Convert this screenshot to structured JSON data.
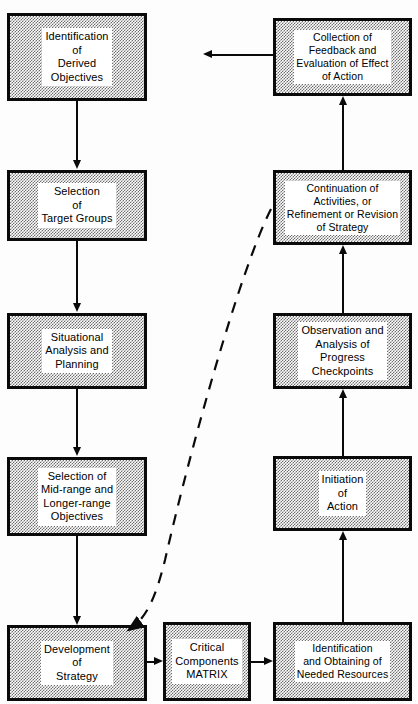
{
  "diagram": {
    "colors": {
      "box_border": "#0a0a0a",
      "box_fill_stipple": "#6e6e6e",
      "label_background": "#ffffff",
      "text": "#000000",
      "connector": "#0a0a0a",
      "page_background": "#fdfdfd"
    },
    "nodes": [
      {
        "id": "identification-of-derived-objectives",
        "text": "Identification\nof\nDerived\nObjectives",
        "column": "left",
        "row": 1
      },
      {
        "id": "selection-of-target-groups",
        "text": "Selection\nof\nTarget Groups",
        "column": "left",
        "row": 2
      },
      {
        "id": "situational-analysis-and-planning",
        "text": "Situational\nAnalysis and\nPlanning",
        "column": "left",
        "row": 3
      },
      {
        "id": "selection-of-mid-range-and-longer-range-objectives",
        "text": "Selection of\nMid-range and\nLonger-range\nObjectives",
        "column": "left",
        "row": 4
      },
      {
        "id": "development-of-strategy",
        "text": "Development\nof\nStrategy",
        "column": "left",
        "row": 5
      },
      {
        "id": "critical-components-matrix",
        "text": "Critical\nComponents\nMATRIX",
        "column": "center",
        "row": 5
      },
      {
        "id": "identification-and-obtaining-of-needed-resources",
        "text": "Identification\nand Obtaining of\nNeeded Resources",
        "column": "right",
        "row": 5
      },
      {
        "id": "initiation-of-action",
        "text": "Initiation\nof\nAction",
        "column": "right",
        "row": 4
      },
      {
        "id": "observation-and-analysis-of-progress-checkpoints",
        "text": "Observation and\nAnalysis of\nProgress\nCheckpoints",
        "column": "right",
        "row": 3
      },
      {
        "id": "continuation-of-activities-or-refinement-or-revision-of-strategy",
        "text": "Continuation of\nActivities, or\nRefinement or Revision\nof Strategy",
        "column": "right",
        "row": 2
      },
      {
        "id": "collection-of-feedback-and-evaluation-of-effect-of-action",
        "text": "Collection of\nFeedback and\nEvaluation of Effect\nof Action",
        "column": "right",
        "row": 1
      }
    ],
    "connectors": [
      {
        "id": "c1",
        "from": "identification-of-derived-objectives",
        "to": "selection-of-target-groups",
        "style": "solid",
        "direction": "down"
      },
      {
        "id": "c2",
        "from": "selection-of-target-groups",
        "to": "situational-analysis-and-planning",
        "style": "solid",
        "direction": "down"
      },
      {
        "id": "c3",
        "from": "situational-analysis-and-planning",
        "to": "selection-of-mid-range-and-longer-range-objectives",
        "style": "solid",
        "direction": "down"
      },
      {
        "id": "c4",
        "from": "selection-of-mid-range-and-longer-range-objectives",
        "to": "development-of-strategy",
        "style": "solid",
        "direction": "down"
      },
      {
        "id": "c5",
        "from": "development-of-strategy",
        "to": "critical-components-matrix",
        "style": "solid",
        "direction": "right"
      },
      {
        "id": "c6",
        "from": "critical-components-matrix",
        "to": "identification-and-obtaining-of-needed-resources",
        "style": "solid",
        "direction": "right"
      },
      {
        "id": "c7",
        "from": "identification-and-obtaining-of-needed-resources",
        "to": "initiation-of-action",
        "style": "solid",
        "direction": "up"
      },
      {
        "id": "c8",
        "from": "initiation-of-action",
        "to": "observation-and-analysis-of-progress-checkpoints",
        "style": "solid",
        "direction": "up"
      },
      {
        "id": "c9",
        "from": "observation-and-analysis-of-progress-checkpoints",
        "to": "continuation-of-activities-or-refinement-or-revision-of-strategy",
        "style": "solid",
        "direction": "up"
      },
      {
        "id": "c10",
        "from": "continuation-of-activities-or-refinement-or-revision-of-strategy",
        "to": "collection-of-feedback-and-evaluation-of-effect-of-action",
        "style": "solid",
        "direction": "up"
      },
      {
        "id": "c11",
        "from": "collection-of-feedback-and-evaluation-of-effect-of-action",
        "to": "identification-of-derived-objectives",
        "style": "solid",
        "direction": "left"
      },
      {
        "id": "c12",
        "from": "continuation-of-activities-or-refinement-or-revision-of-strategy",
        "to": "development-of-strategy",
        "style": "dashed",
        "direction": "curve-down-left"
      }
    ]
  }
}
